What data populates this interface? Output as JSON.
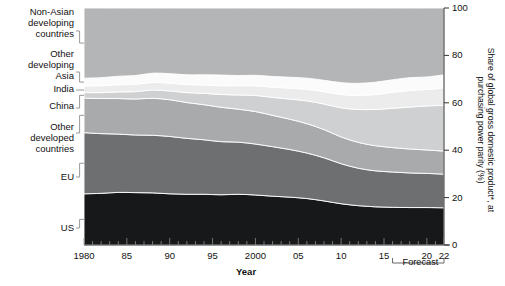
{
  "chart_data": {
    "type": "area",
    "title": "",
    "xlabel": "Year",
    "ylabel": "Share of global gross domestic product*, at purchasing power parity (%)",
    "ylim": [
      0,
      100
    ],
    "xlim": [
      1980,
      2022
    ],
    "grid": false,
    "legend_position": "left-inline-labels",
    "x": [
      1980,
      1982,
      1984,
      1986,
      1988,
      1990,
      1992,
      1994,
      1996,
      1998,
      2000,
      2002,
      2004,
      2006,
      2008,
      2010,
      2012,
      2014,
      2016,
      2018,
      2020,
      2022
    ],
    "y_ticks": [
      0,
      20,
      40,
      60,
      80,
      100
    ],
    "x_ticks": [
      1980,
      1985,
      1990,
      1995,
      2000,
      2005,
      2010,
      2015,
      2020,
      2022
    ],
    "x_tick_labels": [
      "1980",
      "85",
      "90",
      "95",
      "2000",
      "05",
      "10",
      "15",
      "20",
      "22"
    ],
    "forecast_label": "Forecast",
    "forecast_start": 2016,
    "forecast_end": 2022,
    "footnote_marker": "*",
    "series": [
      {
        "name": "US",
        "color": "#17181a",
        "values": [
          21.6,
          21.8,
          22.2,
          22.1,
          22.0,
          21.6,
          21.4,
          21.4,
          21.2,
          21.4,
          21.1,
          20.6,
          20.2,
          19.6,
          18.6,
          17.4,
          16.6,
          16.1,
          15.9,
          15.8,
          15.8,
          15.7
        ]
      },
      {
        "name": "EU",
        "color": "#6e6f71",
        "values": [
          25.8,
          25.2,
          24.6,
          24.3,
          24.3,
          24.2,
          23.6,
          23.0,
          22.4,
          22.0,
          21.5,
          20.9,
          20.1,
          19.2,
          18.2,
          16.9,
          15.8,
          15.2,
          14.9,
          14.6,
          14.4,
          14.2
        ]
      },
      {
        "name": "Other\ndeveloped\ncountries",
        "color": "#a9aaac",
        "values": [
          14.6,
          14.8,
          15.0,
          15.2,
          15.6,
          15.5,
          15.1,
          14.8,
          14.5,
          13.9,
          13.7,
          13.2,
          12.8,
          12.4,
          11.9,
          11.3,
          10.9,
          10.6,
          10.3,
          10.1,
          9.9,
          9.7
        ]
      },
      {
        "name": "China",
        "color": "#cfd0d1",
        "values": [
          2.3,
          2.5,
          2.8,
          3.1,
          3.5,
          3.7,
          4.2,
          4.8,
          5.4,
          6.0,
          6.8,
          7.6,
          8.5,
          9.6,
          10.8,
          12.3,
          13.9,
          15.3,
          16.6,
          17.7,
          18.6,
          19.3
        ]
      },
      {
        "name": "India",
        "color": "#ececec",
        "values": [
          2.8,
          2.9,
          3.0,
          3.1,
          3.2,
          3.3,
          3.4,
          3.5,
          3.7,
          3.9,
          4.1,
          4.3,
          4.6,
          4.9,
          5.2,
          5.6,
          5.9,
          6.3,
          6.7,
          7.0,
          6.9,
          7.4
        ]
      },
      {
        "name": "Other\ndeveloping\nAsia",
        "color": "#fbfbfb",
        "values": [
          3.3,
          3.4,
          3.6,
          3.7,
          3.9,
          4.0,
          4.1,
          4.3,
          4.5,
          4.3,
          4.4,
          4.5,
          4.6,
          4.7,
          4.8,
          5.0,
          5.1,
          5.2,
          5.3,
          5.4,
          5.3,
          5.5
        ]
      },
      {
        "name": "Non-Asian\ndeveloping\ncountries",
        "color": "#b4b5b7",
        "values": [
          29.6,
          29.4,
          28.8,
          28.5,
          27.5,
          27.7,
          28.2,
          28.2,
          28.3,
          28.5,
          28.4,
          28.9,
          29.2,
          29.6,
          30.5,
          31.5,
          31.8,
          31.3,
          30.3,
          29.4,
          29.1,
          28.2
        ]
      }
    ]
  },
  "labels": {
    "non_asian": "Non-Asian\ndeveloping\ncountries",
    "other_dev_asia": "Other\ndeveloping\nAsia",
    "india": "India",
    "china": "China",
    "other_developed": "Other\ndeveloped\ncountries",
    "eu": "EU",
    "us": "US"
  },
  "axis": {
    "x_title": "Year",
    "y_title": "Share of global gross domestic product*, at purchasing power parity (%)",
    "y_tick_labels": [
      "100",
      "80",
      "60",
      "40",
      "20",
      "0"
    ],
    "x_tick_labels": [
      "1980",
      "85",
      "90",
      "95",
      "2000",
      "05",
      "10",
      "15",
      "20",
      "22"
    ],
    "forecast": "Forecast"
  },
  "colors": {
    "us": "#17181a",
    "eu": "#6e6f71",
    "other_developed": "#a9aaac",
    "china": "#cfd0d1",
    "india": "#ececec",
    "other_dev_asia": "#fbfbfb",
    "non_asian": "#b4b5b7",
    "axis": "#333333",
    "text": "#111111",
    "background": "#ffffff"
  }
}
